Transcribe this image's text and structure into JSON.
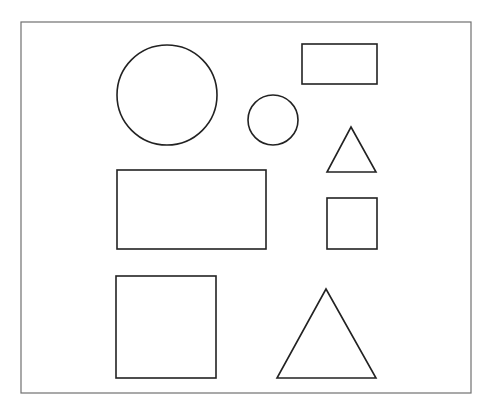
{
  "diagram": {
    "title": "",
    "background": "#ffffff",
    "frame": {
      "x": 21,
      "y": 22,
      "width": 450,
      "height": 371,
      "stroke": "#707070",
      "stroke_width": 1.2
    },
    "stroke_color": "#222222",
    "shapes": [
      {
        "id": "large-circle",
        "type": "circle",
        "cx": 167,
        "cy": 95,
        "r": 50
      },
      {
        "id": "top-rectangle",
        "type": "rect",
        "x": 302,
        "y": 44,
        "width": 75,
        "height": 40
      },
      {
        "id": "small-circle",
        "type": "circle",
        "cx": 273,
        "cy": 120,
        "r": 25
      },
      {
        "id": "small-triangle",
        "type": "triangle",
        "points": [
          [
            351,
            127
          ],
          [
            376,
            172
          ],
          [
            327,
            172
          ]
        ]
      },
      {
        "id": "wide-rectangle",
        "type": "rect",
        "x": 117,
        "y": 170,
        "width": 149,
        "height": 79
      },
      {
        "id": "small-square",
        "type": "rect",
        "x": 327,
        "y": 198,
        "width": 50,
        "height": 51
      },
      {
        "id": "large-square",
        "type": "rect",
        "x": 116,
        "y": 276,
        "width": 100,
        "height": 102
      },
      {
        "id": "large-triangle",
        "type": "triangle",
        "points": [
          [
            326,
            289
          ],
          [
            376,
            378
          ],
          [
            277,
            378
          ]
        ]
      }
    ]
  }
}
